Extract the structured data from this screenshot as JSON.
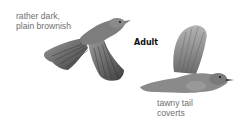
{
  "figure": {
    "title_label": "Adult",
    "annotations": [
      {
        "line1": "rather dark,",
        "line2": "plain brownish"
      },
      {
        "line1": "tawny tail",
        "line2": "coverts"
      }
    ],
    "illustrations": [
      {
        "name": "bird-flying-spread-wings",
        "description": "bird in flight, wings spread downward"
      },
      {
        "name": "bird-flying-raised-wing",
        "description": "bird in flight, wing raised"
      }
    ],
    "colors": {
      "label_text": "#6f6f6f",
      "title_text": "#111111",
      "bird_dark": "#4a4a4a",
      "bird_mid": "#7a7a7a",
      "bird_light": "#a8a8a8"
    }
  }
}
